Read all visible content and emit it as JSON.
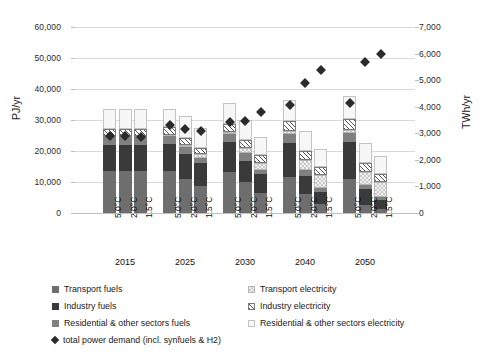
{
  "chart_data": {
    "type": "bar",
    "subtype": "stacked-bar-with-scatter-overlay",
    "title": "",
    "xlabel": "",
    "ylabel": "PJ/yr",
    "ylabel_secondary": "TWh/yr",
    "ylim": [
      0,
      60000
    ],
    "ylim_secondary": [
      0,
      7000
    ],
    "yticks": [
      "0",
      "10,000",
      "20,000",
      "30,000",
      "40,000",
      "50,000",
      "60,000"
    ],
    "ytick_values": [
      0,
      10000,
      20000,
      30000,
      40000,
      50000,
      60000
    ],
    "yticks_secondary": [
      "0",
      "1,000",
      "2,000",
      "3,000",
      "4,000",
      "5,000",
      "6,000",
      "7,000"
    ],
    "ytick_values_secondary": [
      0,
      1000,
      2000,
      3000,
      4000,
      5000,
      6000,
      7000
    ],
    "grid": true,
    "legend_position": "bottom",
    "groups": [
      "2015",
      "2025",
      "2030",
      "2040",
      "2050"
    ],
    "scenarios": [
      "5.0°C",
      "2.0°C",
      "1.5°C"
    ],
    "categories": [
      "2015 5.0°C",
      "2015 2.0°C",
      "2015 1.5°C",
      "2025 5.0°C",
      "2025 2.0°C",
      "2025 1.5°C",
      "2030 5.0°C",
      "2030 2.0°C",
      "2030 1.5°C",
      "2040 5.0°C",
      "2040 2.0°C",
      "2040 1.5°C",
      "2050 5.0°C",
      "2050 2.0°C",
      "2050 1.5°C"
    ],
    "series": [
      {
        "name": "Transport fuels",
        "key": "tf",
        "fill": "solid",
        "color": "#6e6e6e",
        "values": [
          13500,
          13500,
          13500,
          13400,
          11000,
          8800,
          13200,
          9900,
          6500,
          11500,
          6000,
          3000,
          11000,
          2700,
          1200
        ]
      },
      {
        "name": "Industry fuels",
        "key": "if",
        "fill": "solid-dark",
        "color": "#3a3a3a",
        "values": [
          8500,
          8500,
          8500,
          9000,
          7900,
          7300,
          9800,
          6800,
          6000,
          11200,
          6100,
          3900,
          11800,
          5100,
          3100
        ]
      },
      {
        "name": "Residential & other sectors fuels",
        "key": "rf",
        "fill": "solid-mid",
        "color": "#808080",
        "values": [
          2700,
          2700,
          2700,
          2500,
          2400,
          1700,
          2600,
          2600,
          1400,
          2800,
          1900,
          1300,
          2900,
          1300,
          1000
        ]
      },
      {
        "name": "Transport electricity",
        "key": "te",
        "fill": "checker",
        "color": "#f2f2f2",
        "values": [
          300,
          300,
          300,
          400,
          700,
          1200,
          500,
          1700,
          2300,
          900,
          3000,
          4000,
          1200,
          4200,
          4800
        ]
      },
      {
        "name": "Industry electricity",
        "key": "ie",
        "fill": "hatch",
        "color": "#ffffff",
        "values": [
          2000,
          2000,
          2000,
          2300,
          2200,
          2000,
          2600,
          2600,
          2400,
          3200,
          2900,
          2600,
          3400,
          2900,
          2600
        ]
      },
      {
        "name": "Residential & other sectors electricity",
        "key": "re",
        "fill": "light",
        "color": "#f7f7f7",
        "values": [
          6500,
          6500,
          6500,
          6000,
          7000,
          6500,
          6800,
          6500,
          5900,
          7000,
          6400,
          5800,
          7300,
          6300,
          5700
        ]
      }
    ],
    "overlay": {
      "name": "total power demand (incl. synfuels & H2)",
      "marker": "diamond",
      "color": "#2b2b2b",
      "axis": "secondary",
      "unit": "TWh/yr",
      "values": [
        2900,
        2880,
        2860,
        3320,
        3150,
        3080,
        3420,
        3480,
        3800,
        4050,
        4900,
        5400,
        4150,
        5700,
        6000
      ]
    }
  },
  "legend": {
    "items": [
      {
        "label": "Transport fuels",
        "swatch": "tf"
      },
      {
        "label": "Transport electricity",
        "swatch": "te"
      },
      {
        "label": "Industry fuels",
        "swatch": "if"
      },
      {
        "label": "Industry electricity",
        "swatch": "ie"
      },
      {
        "label": "Residential & other sectors fuels",
        "swatch": "rf"
      },
      {
        "label": "Residential & other sectors electricity",
        "swatch": "re"
      },
      {
        "label": "total power demand (incl. synfuels & H2)",
        "swatch": "diamond"
      }
    ]
  }
}
